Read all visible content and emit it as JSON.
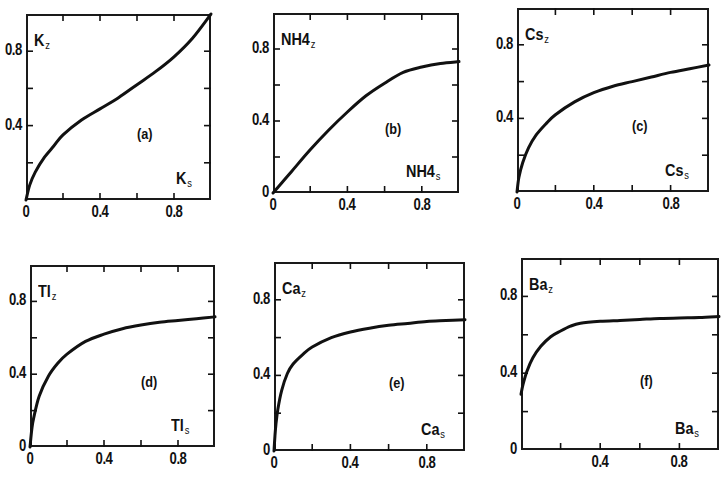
{
  "figure": {
    "layout": "2x3 grid of ion-exchange isotherm panels",
    "line_color": "#111111",
    "background": "#ffffff"
  },
  "chart_data": [
    {
      "type": "line",
      "panel": "(a)",
      "ylabel": "K",
      "ylabel_sub": "z",
      "xlabel": "K",
      "xlabel_sub": "s",
      "xlim": [
        0,
        1
      ],
      "ylim": [
        0,
        1
      ],
      "xticks": [
        "0",
        "0.4",
        "0.8"
      ],
      "yticks": [
        "0.4",
        "0.8"
      ],
      "minor_ticks_step": 0.2,
      "x": [
        0,
        0.02,
        0.05,
        0.1,
        0.15,
        0.2,
        0.3,
        0.4,
        0.5,
        0.6,
        0.7,
        0.8,
        0.9,
        1.0
      ],
      "y": [
        0.0,
        0.08,
        0.15,
        0.23,
        0.29,
        0.35,
        0.43,
        0.49,
        0.55,
        0.62,
        0.69,
        0.77,
        0.87,
        1.0
      ]
    },
    {
      "type": "line",
      "panel": "(b)",
      "ylabel": "NH",
      "ylabel_mid": "4",
      "ylabel_sub": "z",
      "xlabel": "NH",
      "xlabel_mid": "4",
      "xlabel_sub": "s",
      "xlim": [
        0,
        1
      ],
      "ylim": [
        0,
        1
      ],
      "xticks": [
        "0",
        "0.4",
        "0.8"
      ],
      "yticks": [
        "0",
        "0.4",
        "0.8"
      ],
      "minor_ticks_step": 0.2,
      "x": [
        0,
        0.05,
        0.1,
        0.2,
        0.3,
        0.4,
        0.5,
        0.6,
        0.7,
        0.8,
        0.9,
        1.0
      ],
      "y": [
        0.0,
        0.06,
        0.12,
        0.24,
        0.35,
        0.45,
        0.54,
        0.61,
        0.67,
        0.7,
        0.72,
        0.73
      ]
    },
    {
      "type": "line",
      "panel": "(c)",
      "ylabel": "Cs",
      "ylabel_sub": "z",
      "xlabel": "Cs",
      "xlabel_sub": "s",
      "xlim": [
        0,
        1
      ],
      "ylim": [
        0,
        1
      ],
      "xticks": [
        "0",
        "0.4",
        "0.8"
      ],
      "yticks": [
        "0.4",
        "0.8"
      ],
      "minor_ticks_step": 0.2,
      "x": [
        0,
        0.01,
        0.03,
        0.06,
        0.1,
        0.15,
        0.2,
        0.3,
        0.4,
        0.5,
        0.6,
        0.7,
        0.8,
        0.9,
        1.0
      ],
      "y": [
        0.0,
        0.08,
        0.16,
        0.24,
        0.31,
        0.37,
        0.42,
        0.49,
        0.54,
        0.575,
        0.6,
        0.625,
        0.65,
        0.67,
        0.69
      ]
    },
    {
      "type": "line",
      "panel": "(d)",
      "ylabel": "Tl",
      "ylabel_sub": "z",
      "xlabel": "Tl",
      "xlabel_sub": "s",
      "xlim": [
        0,
        1
      ],
      "ylim": [
        0,
        1
      ],
      "xticks": [
        "0",
        "0.4",
        "0.8"
      ],
      "yticks": [
        "0",
        "0.4",
        "0.8"
      ],
      "minor_ticks_step": 0.2,
      "x": [
        0,
        0.01,
        0.02,
        0.05,
        0.1,
        0.15,
        0.2,
        0.3,
        0.4,
        0.5,
        0.6,
        0.7,
        0.8,
        0.9,
        1.0
      ],
      "y": [
        0.0,
        0.1,
        0.16,
        0.28,
        0.39,
        0.46,
        0.51,
        0.58,
        0.62,
        0.65,
        0.67,
        0.685,
        0.695,
        0.705,
        0.715
      ]
    },
    {
      "type": "line",
      "panel": "(e)",
      "ylabel": "Ca",
      "ylabel_sub": "z",
      "xlabel": "Ca",
      "xlabel_sub": "s",
      "xlim": [
        0,
        1
      ],
      "ylim": [
        0,
        1
      ],
      "xticks": [
        "0",
        "0.4",
        "0.8"
      ],
      "yticks": [
        "0",
        "0.4",
        "0.8"
      ],
      "minor_ticks_step": 0.2,
      "x": [
        0,
        0.005,
        0.01,
        0.02,
        0.04,
        0.07,
        0.1,
        0.15,
        0.2,
        0.3,
        0.4,
        0.5,
        0.6,
        0.7,
        0.8,
        0.9,
        1.0
      ],
      "y": [
        0.0,
        0.08,
        0.14,
        0.22,
        0.32,
        0.41,
        0.46,
        0.51,
        0.55,
        0.6,
        0.63,
        0.65,
        0.665,
        0.675,
        0.685,
        0.69,
        0.695
      ]
    },
    {
      "type": "line",
      "panel": "(f)",
      "ylabel": "Ba",
      "ylabel_sub": "z",
      "xlabel": "Ba",
      "xlabel_sub": "s",
      "xlim": [
        0,
        1
      ],
      "ylim": [
        0,
        1
      ],
      "xticks": [
        "0.4",
        "0.8"
      ],
      "yticks": [
        "0",
        "0.4",
        "0.8"
      ],
      "minor_ticks_step": 0.2,
      "x": [
        0,
        0.01,
        0.03,
        0.06,
        0.1,
        0.15,
        0.2,
        0.25,
        0.3,
        0.4,
        0.5,
        0.6,
        0.7,
        0.8,
        0.9,
        1.0
      ],
      "y": [
        0.29,
        0.34,
        0.41,
        0.48,
        0.54,
        0.59,
        0.62,
        0.645,
        0.66,
        0.67,
        0.675,
        0.68,
        0.685,
        0.688,
        0.69,
        0.695
      ]
    }
  ],
  "panels_geometry": [
    {
      "left": 26,
      "top": 14,
      "right": 211,
      "bottom": 200
    },
    {
      "left": 273,
      "top": 13,
      "right": 459,
      "bottom": 193
    },
    {
      "left": 517,
      "top": 8,
      "right": 709,
      "bottom": 192
    },
    {
      "left": 30,
      "top": 265,
      "right": 215,
      "bottom": 447
    },
    {
      "left": 274,
      "top": 262,
      "right": 465,
      "bottom": 451
    },
    {
      "left": 521,
      "top": 258,
      "right": 719,
      "bottom": 450
    }
  ]
}
